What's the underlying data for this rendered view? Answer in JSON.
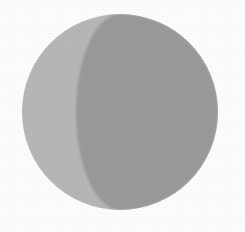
{
  "figure": {
    "title": "Gibbous Moon Phase",
    "alt_text": "Grey circle with a darker crescent-shaped shaded region along its right side",
    "canvas": {
      "width": 245,
      "height": 232,
      "background_color": "#ffffff"
    },
    "disc": {
      "name": "moon-disc",
      "center_x": 120,
      "center_y": 112,
      "radius": 98,
      "lit_color": "#b8b8b8",
      "shadow_color": "#9b9b9b",
      "edge_softness_px": 1.2
    },
    "terminator": {
      "name": "terminator-arc",
      "description": "elliptical arc bulging toward the lit side",
      "top_anchor_x": 172,
      "top_anchor_y": 30,
      "bottom_anchor_x": 180,
      "bottom_anchor_y": 197,
      "apex_x": 136,
      "apex_y": 115,
      "semi_minor_axis": 44,
      "semi_major_axis": 98
    },
    "texture": {
      "name": "paper-grain",
      "opacity": 0.055
    }
  }
}
